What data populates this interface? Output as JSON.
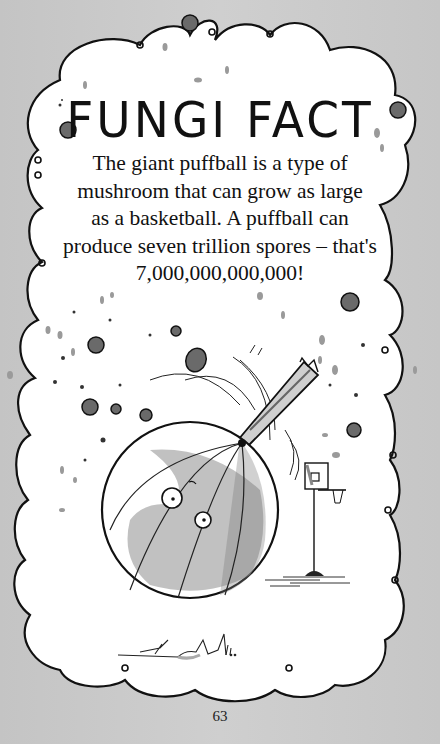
{
  "page": {
    "title": "FUNGI FACT",
    "body_lines": [
      "The giant puffball is a type of",
      "mushroom that can grow as large",
      "as a basketball. A puffball can",
      "produce seven trillion spores – that's",
      "7,000,000,000,000!"
    ],
    "page_number": "63"
  },
  "illustration": {
    "subjects": [
      "giant-puffball-with-face",
      "stick-poking-puffball",
      "basketball-hoop",
      "floating-spores"
    ],
    "colors": {
      "background": "#c9c9c9",
      "cloud_fill": "#ffffff",
      "ink": "#111111",
      "wash_gray": "#8a8a8a"
    }
  }
}
